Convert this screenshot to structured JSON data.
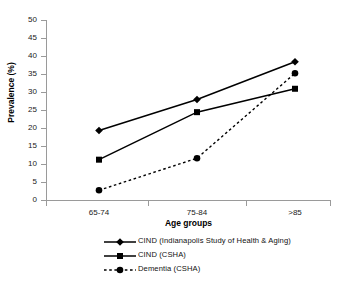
{
  "chart_data": {
    "type": "line",
    "title": "",
    "xlabel": "Age groups",
    "ylabel": "Prevalence (%)",
    "categories": [
      "65-74",
      "75-84",
      ">85"
    ],
    "ylim": [
      0,
      50
    ],
    "yticks": [
      0,
      5,
      10,
      15,
      20,
      25,
      30,
      35,
      40,
      45,
      50
    ],
    "grid": false,
    "legend_position": "bottom",
    "series": [
      {
        "name": "CIND (Indianapolis Study of Health & Aging)",
        "values": [
          19.3,
          27.9,
          38.4
        ],
        "marker": "diamond",
        "linestyle": "solid",
        "color": "#000000"
      },
      {
        "name": "CIND (CSHA)",
        "values": [
          11.2,
          24.4,
          30.9
        ],
        "marker": "square",
        "linestyle": "solid",
        "color": "#000000"
      },
      {
        "name": "Dementia (CSHA)",
        "values": [
          2.7,
          11.6,
          35.2
        ],
        "marker": "circle",
        "linestyle": "dashed",
        "color": "#000000"
      }
    ]
  },
  "axes": {
    "y_title": "Prevalence (%)",
    "x_title": "Age groups",
    "y_tick_labels": [
      "0",
      "5",
      "10",
      "15",
      "20",
      "25",
      "30",
      "35",
      "40",
      "45",
      "50"
    ],
    "x_tick_labels": [
      "65-74",
      "75-84",
      ">85"
    ]
  },
  "legend": {
    "entries": [
      {
        "label": "CIND (Indianapolis Study of Health & Aging)",
        "marker": "diamond-marker",
        "style": "solid"
      },
      {
        "label": "CIND (CSHA)",
        "marker": "square-marker",
        "style": "solid"
      },
      {
        "label": "Dementia (CSHA)",
        "marker": "circle-marker",
        "style": "dashed"
      }
    ]
  },
  "colors": {
    "ink": "#000000",
    "axis": "#9a9a9a",
    "background": "#ffffff"
  }
}
